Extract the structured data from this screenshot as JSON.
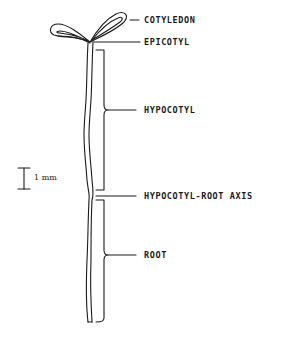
{
  "diagram": {
    "labels": {
      "cotyledon": "COTYLEDON",
      "epicotyl": "EPICOTYL",
      "hypocotyl": "HYPOCOTYL",
      "hypocotyl_root_axis": "HYPOCOTYL-ROOT AXIS",
      "root": "ROOT"
    },
    "scale_bar": {
      "label": "1 mm"
    },
    "colors": {
      "ink": "#1a1a1a",
      "background": "#ffffff"
    }
  }
}
